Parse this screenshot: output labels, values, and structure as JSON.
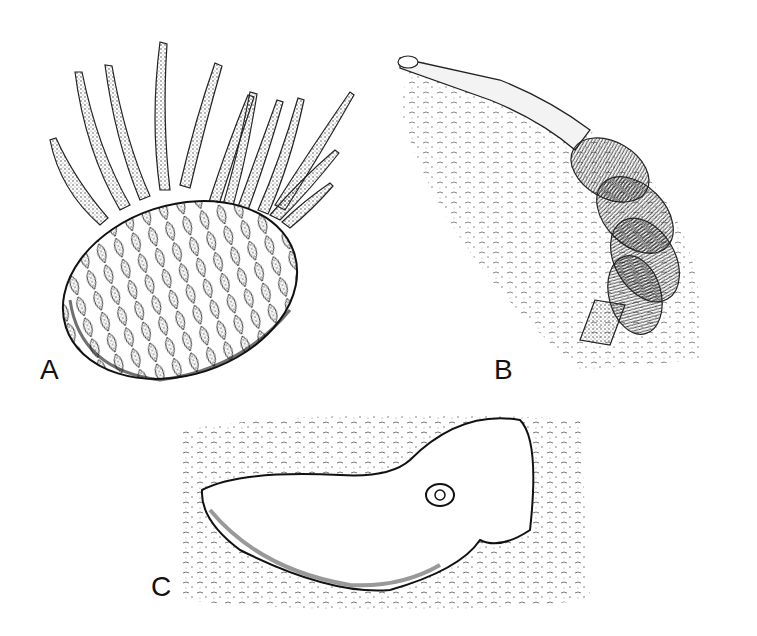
{
  "figure": {
    "panels": [
      {
        "id": "A",
        "label": "A",
        "subject": "spiny scaled organism with elongated spines"
      },
      {
        "id": "B",
        "label": "B",
        "subject": "segmented tubular organism with bristle tufts in sediment"
      },
      {
        "id": "C",
        "label": "C",
        "subject": "flattened sac-like organism on textured sediment"
      }
    ],
    "colors": {
      "ink": "#1a1a1a",
      "paper": "#ffffff",
      "stipple": "#555555"
    }
  }
}
